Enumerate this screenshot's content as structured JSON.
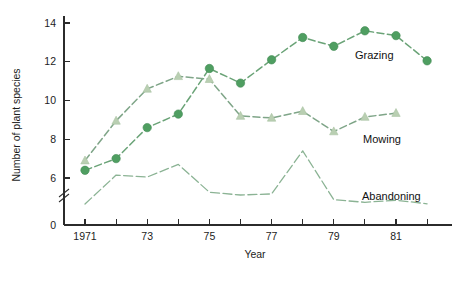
{
  "chart_data": {
    "type": "line",
    "title": "",
    "xlabel": "Year",
    "ylabel": "Number of plant species",
    "x": [
      1971,
      1972,
      1973,
      1974,
      1975,
      1976,
      1977,
      1978,
      1979,
      1980,
      1981,
      1982
    ],
    "xtick_labels": [
      "1971",
      "",
      "73",
      "",
      "75",
      "",
      "77",
      "",
      "79",
      "",
      "81",
      ""
    ],
    "ytick_labels": [
      "0",
      "6",
      "8",
      "10",
      "12",
      "14"
    ],
    "ylim": [
      0,
      14.6
    ],
    "y_axis_break": true,
    "y_break_between": [
      0,
      6
    ],
    "grid": false,
    "legend_position": "inline-right",
    "series": [
      {
        "name": "Grazing",
        "marker": "circle",
        "color": "#4f9e61",
        "line_color": "#6aa377",
        "line_style": "dashed",
        "values": [
          6.4,
          7.0,
          8.6,
          9.3,
          11.65,
          10.9,
          12.1,
          13.25,
          12.8,
          13.6,
          13.35,
          12.05
        ]
      },
      {
        "name": "Mowing",
        "marker": "triangle",
        "color": "#b9cfb2",
        "line_color": "#7fa588",
        "line_style": "dashed",
        "values": [
          6.9,
          8.95,
          10.6,
          11.25,
          11.1,
          9.2,
          9.1,
          9.45,
          8.4,
          9.15,
          9.35,
          null
        ]
      },
      {
        "name": "Abandoning",
        "marker": "none",
        "color": "#8bb394",
        "line_color": "#8bb394",
        "line_style": "dashed",
        "values": [
          3.2,
          6.15,
          6.05,
          6.7,
          5.95,
          5.3,
          5.55,
          7.4,
          4.2,
          3.6,
          4.1,
          3.25
        ]
      }
    ],
    "annotations": [
      {
        "text": "Grazing",
        "x_px": 355,
        "y_px": 59
      },
      {
        "text": "Mowing",
        "x_px": 363,
        "y_px": 143
      },
      {
        "text": "Abandoning",
        "x_px": 362,
        "y_px": 200
      }
    ]
  }
}
